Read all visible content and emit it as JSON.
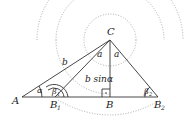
{
  "diagram": {
    "points": {
      "A": "A",
      "B1": "B",
      "B1_sub": "1",
      "B": "B",
      "B2": "B",
      "B2_sub": "2",
      "C": "C"
    },
    "sides": {
      "b": "b",
      "a_left": "a",
      "a_right": "a",
      "height": "b sinα"
    },
    "angles": {
      "alpha": "α",
      "beta1": "β",
      "beta1_sub": "1",
      "beta2": "β",
      "beta2_sub": "2",
      "right_angle_mark": "·"
    }
  }
}
